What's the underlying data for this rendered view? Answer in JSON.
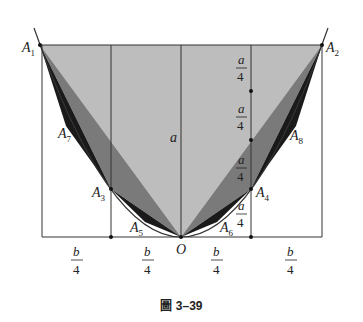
{
  "figure": {
    "caption": "圖 3–39",
    "points": {
      "A1": "A1",
      "A2": "A2",
      "A3": "A3",
      "A4": "A4",
      "A5": "A5",
      "A6": "A6",
      "A7": "A7",
      "A8": "A8",
      "O": "O"
    },
    "labels": {
      "a": "a",
      "a_over_4": {
        "num": "a",
        "den": "4"
      },
      "b_over_4": {
        "num": "b",
        "den": "4"
      }
    },
    "colors": {
      "large_triangle": "#bdbdbd",
      "mid_triangles": "#7a7a7a",
      "small_triangles": "#1a1a1a",
      "lines": "#333333"
    }
  }
}
